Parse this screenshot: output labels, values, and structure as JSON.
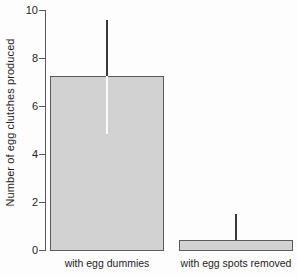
{
  "chart_data": {
    "type": "bar",
    "title": "",
    "xlabel": "",
    "ylabel": "Number of egg clutches produced",
    "categories": [
      "with egg dummies",
      "with egg spots removed"
    ],
    "values": [
      7.25,
      0.4
    ],
    "errors_upper": [
      9.6,
      1.5
    ],
    "errors_lower": [
      4.85,
      0.4
    ],
    "ylim": [
      0,
      10
    ],
    "yticks": [
      0,
      2,
      4,
      6,
      8,
      10
    ],
    "ytick_labels": [
      "0",
      "2",
      "4",
      "6",
      "8",
      "10"
    ],
    "grid": false,
    "legend": "none",
    "bar_fill_color": "#d2d2d2",
    "bar_edge_color": "#5c5c5c",
    "error_bar_color": "#3a3a3a",
    "axis_color": "#595959"
  },
  "axis": {
    "tick_0": "0",
    "tick_2": "2",
    "tick_4": "4",
    "tick_6": "6",
    "tick_8": "8",
    "tick_10": "10"
  },
  "categories": {
    "cat_1": "with egg dummies",
    "cat_2": "with egg spots removed"
  },
  "labels": {
    "y_axis_title": "Number of egg clutches produced"
  }
}
